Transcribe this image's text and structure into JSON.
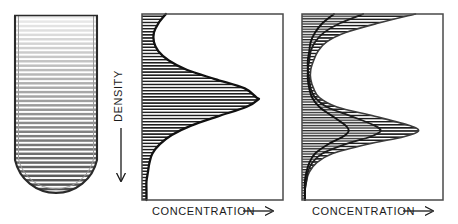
{
  "figure": {
    "background_color": "#ffffff",
    "line_color": "#111111",
    "hatch_color": "#2b2b2b"
  },
  "panels": [
    {
      "id": "gradient-tube",
      "name": "centrifuge-tube",
      "shape": "round-bottom-tube",
      "fill_style": "horizontal-stripes",
      "gradient_direction": "top-light-to-bottom-dark",
      "stripe_count": 42,
      "bounds": {
        "x": 13,
        "y": 14,
        "width": 86,
        "height": 188
      }
    },
    {
      "id": "single-band",
      "name": "single-band-profile",
      "frame": {
        "x": 142,
        "y": 14,
        "width": 141,
        "height": 186
      },
      "xlabel": "CONCENTRATION",
      "xlabel_arrow": "→",
      "curve_count": 1
    },
    {
      "id": "multi-band",
      "name": "multi-band-profile",
      "frame": {
        "x": 302,
        "y": 14,
        "width": 141,
        "height": 186
      },
      "xlabel": "CONCENTRATION",
      "xlabel_arrow": "→",
      "curve_count": 3
    }
  ],
  "axis": {
    "density_label": "DENSITY",
    "density_arrow": "↓",
    "density_arrow_direction": "down",
    "concentration_label": "CONCENTRATION",
    "concentration_arrow": "→",
    "concentration_arrow_direction": "right"
  },
  "chart_data": {
    "type": "area",
    "xlabel": "CONCENTRATION",
    "ylabel": "DENSITY",
    "orientation": "horizontal-profile-vertical-density",
    "xlim": [
      0,
      100
    ],
    "ylim": [
      0,
      100
    ],
    "ylabel_direction": "increasing downward",
    "grid": false,
    "legend": "none",
    "panels": [
      {
        "panel": "gradient-tube",
        "type": "gradient",
        "description": "Round-bottom centrifuge tube filled with a continuous density gradient drawn as horizontal stripes, light at top and dark at bottom",
        "stripe_count": 42,
        "shade_top": 0.08,
        "shade_bottom": 0.72
      },
      {
        "panel": "single-band",
        "type": "area",
        "description": "Single symmetric concentration band at mid density",
        "series": [
          {
            "name": "band-1",
            "peak_density": 46,
            "peak_concentration": 78,
            "baseline_concentration": 3,
            "width_at_half_max": 22
          }
        ],
        "density_samples": [
          0,
          5,
          10,
          15,
          20,
          25,
          30,
          35,
          40,
          45,
          46,
          50,
          55,
          60,
          65,
          70,
          75,
          80,
          85,
          90,
          95,
          100
        ],
        "concentration_values": [
          16,
          11,
          8,
          8,
          11,
          18,
          30,
          49,
          69,
          77,
          78,
          70,
          51,
          33,
          20,
          12,
          7,
          5,
          4,
          3,
          3,
          3
        ]
      },
      {
        "panel": "multi-band",
        "type": "area",
        "description": "Three overlapping runs showing progressive band sharpening; each curve has a broad upper shoulder and a sharper lower band",
        "series": [
          {
            "name": "curve-1-sharpest",
            "upper_shoulder_concentration": 22,
            "lower_peak_density": 63,
            "lower_peak_concentration": 32,
            "baseline_concentration": 2
          },
          {
            "name": "curve-2-intermediate",
            "upper_shoulder_concentration": 42,
            "lower_peak_density": 63,
            "lower_peak_concentration": 54,
            "baseline_concentration": 2
          },
          {
            "name": "curve-3-broadest",
            "upper_shoulder_concentration": 78,
            "lower_peak_density": 63,
            "lower_peak_concentration": 80,
            "baseline_concentration": 2
          }
        ],
        "density_samples": [
          0,
          5,
          10,
          15,
          20,
          25,
          30,
          35,
          40,
          45,
          50,
          55,
          60,
          63,
          66,
          70,
          75,
          80,
          85,
          90,
          95,
          100
        ],
        "concentration_values_curve1": [
          22,
          14,
          9,
          6,
          5,
          4,
          4,
          4,
          5,
          7,
          12,
          21,
          30,
          32,
          28,
          18,
          9,
          5,
          3,
          2,
          2,
          2
        ],
        "concentration_values_curve2": [
          42,
          26,
          15,
          9,
          6,
          5,
          4,
          5,
          6,
          9,
          17,
          34,
          50,
          54,
          47,
          30,
          14,
          7,
          4,
          3,
          2,
          2
        ],
        "concentration_values_curve3": [
          78,
          52,
          30,
          17,
          11,
          8,
          6,
          6,
          8,
          12,
          24,
          50,
          74,
          80,
          70,
          45,
          21,
          10,
          5,
          3,
          2,
          2
        ]
      }
    ]
  }
}
